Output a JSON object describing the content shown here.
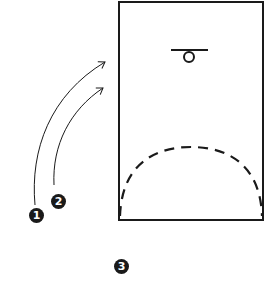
{
  "diagram": {
    "type": "basketball-half-court-play",
    "court": {
      "x": 119,
      "y": 2,
      "width": 144,
      "height": 218,
      "stroke": "#1a1a1a"
    },
    "basket": {
      "backboard": {
        "x1": 171,
        "y1": 50,
        "x2": 208,
        "y2": 50
      },
      "hoop": {
        "cx": 189,
        "cy": 57,
        "r": 5
      }
    },
    "three_point_arc": {
      "style": "dashed",
      "from": [
        119,
        216
      ],
      "apex": [
        191,
        147
      ],
      "to": [
        263,
        216
      ]
    },
    "paths": [
      {
        "id": "1",
        "from": [
          35,
          205
        ],
        "to": [
          105,
          62
        ],
        "style": "arrow"
      },
      {
        "id": "2",
        "from": [
          54,
          185
        ],
        "to": [
          103,
          88
        ],
        "style": "arrow"
      }
    ],
    "players": [
      {
        "id": "1",
        "label": "1",
        "x": 36,
        "y": 215
      },
      {
        "id": "2",
        "label": "2",
        "x": 58,
        "y": 201
      },
      {
        "id": "3",
        "label": "3",
        "x": 122,
        "y": 266
      }
    ]
  }
}
